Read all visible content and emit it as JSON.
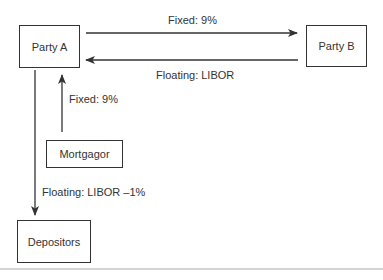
{
  "diagram": {
    "nodes": [
      {
        "id": "party-a",
        "label": "Party A"
      },
      {
        "id": "party-b",
        "label": "Party B"
      },
      {
        "id": "mortgagor",
        "label": "Mortgagor"
      },
      {
        "id": "depositors",
        "label": "Depositors"
      }
    ],
    "edges": [
      {
        "from": "party-a",
        "to": "party-b",
        "label": "Fixed: 9%"
      },
      {
        "from": "party-b",
        "to": "party-a",
        "label": "Floating: LIBOR"
      },
      {
        "from": "mortgagor",
        "to": "party-a",
        "label": "Fixed: 9%"
      },
      {
        "from": "party-a",
        "to": "depositors",
        "label": "Floating: LIBOR –1%"
      }
    ]
  },
  "colors": {
    "line": "#333333",
    "divider": "#d4d4d4"
  }
}
